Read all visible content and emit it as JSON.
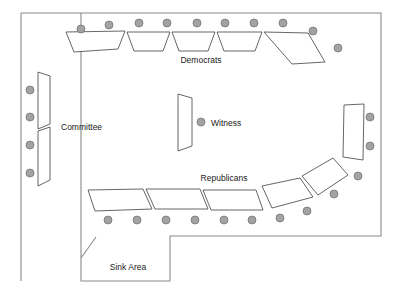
{
  "diagram": {
    "colors": {
      "wall_stroke": "#8a8a8a",
      "desk_fill": "#ffffff",
      "desk_stroke": "#555555",
      "seat_fill": "#a3a3a3",
      "seat_stroke": "#6d6d6d",
      "background": "#ffffff",
      "label_text": "#1a1a1a"
    },
    "labels": {
      "democrats": "Democrats",
      "republicans": "Republicans",
      "committee": "Committee",
      "witness": "Witness",
      "sink_area": "Sink Area"
    },
    "seat_counts": {
      "democrats": 10,
      "republicans": 13,
      "committee": 4,
      "witness": 1,
      "total": 28
    },
    "room": {
      "outline_points": "21,13 381,13 381,236 170,236 170,281 81,281 81,258 81,13 21,13",
      "left_wall": "21,13 21,281"
    },
    "sink": {
      "outline_points": "81,258 81,281 170,281 170,236 381,236",
      "diagonal": "81,258 96,237"
    },
    "desks": {
      "democrats": [
        "66,32 125,31 118,49 74,52",
        "127,32 170,32 163,51 134,51",
        "172,32 215,32 208,51 179,51",
        "217,32 262,32 255,51 224,51",
        "264,32 308,33 325,62 292,64"
      ],
      "republicans": [
        "88,190 143,189 152,209 95,211",
        "146,189 200,189 208,209 155,209",
        "203,189 256,190 263,210 211,210",
        "262,186 300,178 313,197 272,208",
        "302,176 333,158 348,175 318,195",
        "344,105 364,104 363,160 343,157"
      ],
      "committee": [
        "38,72 50,76 50,124 38,129",
        "38,131 50,127 50,180 38,186"
      ],
      "witness": [
        "178,94 192,98 192,146 178,151"
      ]
    },
    "seats": {
      "democrats_row": [
        {
          "cx": 81,
          "cy": 29
        },
        {
          "cx": 109,
          "cy": 25
        },
        {
          "cx": 139,
          "cy": 23
        },
        {
          "cx": 167,
          "cy": 23
        },
        {
          "cx": 197,
          "cy": 23
        },
        {
          "cx": 225,
          "cy": 23
        },
        {
          "cx": 254,
          "cy": 23
        },
        {
          "cx": 283,
          "cy": 23
        },
        {
          "cx": 313,
          "cy": 31
        },
        {
          "cx": 338,
          "cy": 48
        }
      ],
      "committee_col": [
        {
          "cx": 30,
          "cy": 90
        },
        {
          "cx": 30,
          "cy": 117
        },
        {
          "cx": 30,
          "cy": 145
        },
        {
          "cx": 30,
          "cy": 173
        }
      ],
      "witness_seat": [
        {
          "cx": 201,
          "cy": 122
        }
      ],
      "republicans_row": [
        {
          "cx": 108,
          "cy": 220
        },
        {
          "cx": 137,
          "cy": 220
        },
        {
          "cx": 166,
          "cy": 220
        },
        {
          "cx": 195,
          "cy": 220
        },
        {
          "cx": 224,
          "cy": 220
        },
        {
          "cx": 252,
          "cy": 220
        },
        {
          "cx": 280,
          "cy": 218
        },
        {
          "cx": 307,
          "cy": 211
        },
        {
          "cx": 334,
          "cy": 194
        },
        {
          "cx": 358,
          "cy": 176
        },
        {
          "cx": 370,
          "cy": 146
        },
        {
          "cx": 370,
          "cy": 117
        }
      ]
    },
    "label_positions": {
      "democrats": {
        "x": 201,
        "y": 63
      },
      "republicans": {
        "x": 224,
        "y": 181
      },
      "committee": {
        "x": 61,
        "y": 130
      },
      "witness": {
        "x": 211,
        "y": 126
      },
      "sink_area": {
        "x": 128,
        "y": 270
      }
    }
  }
}
